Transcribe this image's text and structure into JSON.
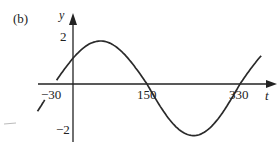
{
  "panel_label": "(b)",
  "chart_data": {
    "type": "line",
    "title": "",
    "xlabel": "t",
    "ylabel": "y",
    "function": "y = 2 sin(t + 30)",
    "x_ticks": [
      -30,
      150,
      330
    ],
    "y_ticks": [
      2,
      -2
    ],
    "x_tick_labels": [
      "-30",
      "150",
      "330"
    ],
    "y_tick_labels": [
      "2",
      "-2"
    ],
    "xlim": [
      -60,
      390
    ],
    "ylim": [
      -2.2,
      2.6
    ],
    "grid": false,
    "series": [
      {
        "name": "y",
        "x": [
          -60,
          -30,
          0,
          30,
          60,
          90,
          120,
          150,
          180,
          210,
          240,
          270,
          300,
          330,
          360,
          375
        ],
        "values": [
          -1,
          0,
          1,
          1.73,
          2,
          1.73,
          1,
          0,
          -1,
          -1.73,
          -2,
          -1.73,
          -1,
          0,
          1,
          1.41
        ]
      }
    ],
    "key_points": {
      "x_intercepts": [
        -30,
        150,
        330
      ],
      "max": {
        "t": 60,
        "y": 2
      },
      "min": {
        "t": 240,
        "y": -2
      }
    }
  },
  "labels": {
    "y_axis": "y",
    "x_axis": "t",
    "tick_neg30": "−30",
    "tick_150": "150",
    "tick_330": "330",
    "tick_y2": "2",
    "tick_yneg2": "−2"
  }
}
